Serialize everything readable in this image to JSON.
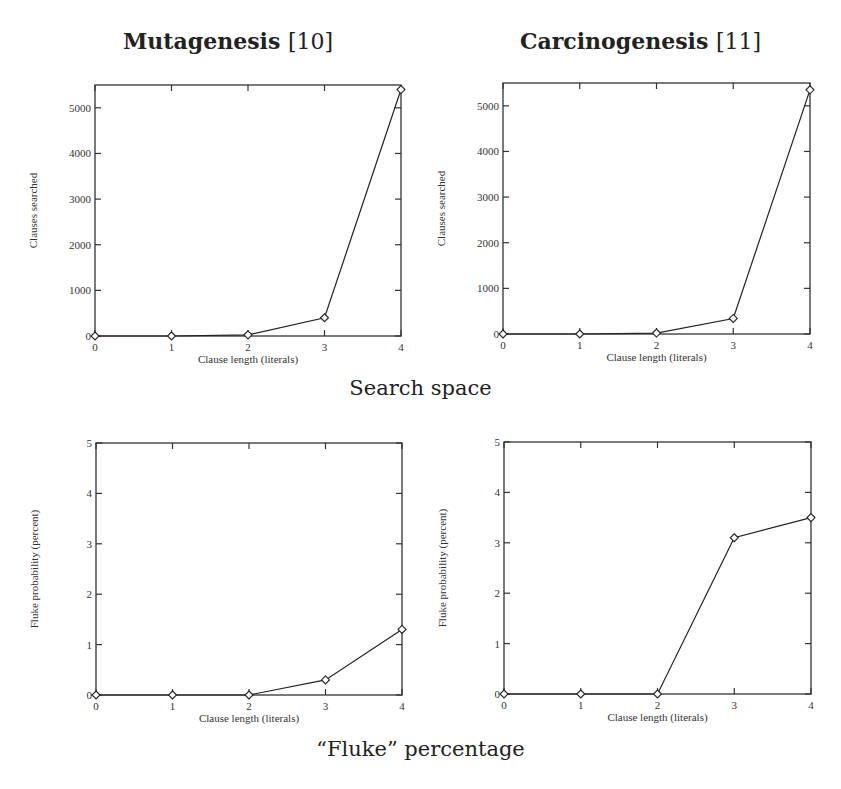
{
  "columns": [
    {
      "title": "Mutagenesis",
      "ref": "[10]"
    },
    {
      "title": "Carcinogenesis",
      "ref": "[11]"
    }
  ],
  "captions": {
    "search_space": "Search space",
    "fluke": "“Fluke”  percentage"
  },
  "chart_data": [
    {
      "type": "line",
      "title": "Mutagenesis [10]",
      "panel": "Search space",
      "xlabel": "Clause length (literals)",
      "ylabel": "Clauses searched",
      "x": [
        0,
        1,
        2,
        3,
        4
      ],
      "series": [
        {
          "name": "Clauses searched",
          "values": [
            0,
            0,
            25,
            400,
            5400
          ],
          "marker": "diamond"
        }
      ],
      "xlim": [
        0,
        4
      ],
      "ylim": [
        0,
        5500
      ],
      "xticks": [
        0,
        1,
        2,
        3,
        4
      ],
      "yticks": [
        0,
        1000,
        2000,
        3000,
        4000,
        5000
      ],
      "grid": false,
      "legend": null
    },
    {
      "type": "line",
      "title": "Carcinogenesis [11]",
      "panel": "Search space",
      "xlabel": "Clause length (literals)",
      "ylabel": "Clauses searched",
      "x": [
        0,
        1,
        2,
        3,
        4
      ],
      "series": [
        {
          "name": "Clauses searched",
          "values": [
            0,
            0,
            20,
            340,
            5350
          ],
          "marker": "diamond"
        }
      ],
      "xlim": [
        0,
        4
      ],
      "ylim": [
        0,
        5500
      ],
      "xticks": [
        0,
        1,
        2,
        3,
        4
      ],
      "yticks": [
        0,
        1000,
        2000,
        3000,
        4000,
        5000
      ],
      "grid": false,
      "legend": null
    },
    {
      "type": "line",
      "title": "Mutagenesis [10]",
      "panel": "“Fluke” percentage",
      "xlabel": "Clause length (literals)",
      "ylabel": "Fluke probability (percent)",
      "x": [
        0,
        1,
        2,
        3,
        4
      ],
      "series": [
        {
          "name": "Fluke probability",
          "values": [
            0,
            0,
            0,
            0.3,
            1.3
          ],
          "marker": "diamond"
        }
      ],
      "xlim": [
        0,
        4
      ],
      "ylim": [
        0,
        5
      ],
      "xticks": [
        0,
        1,
        2,
        3,
        4
      ],
      "yticks": [
        0,
        1,
        2,
        3,
        4,
        5
      ],
      "grid": false,
      "legend": null
    },
    {
      "type": "line",
      "title": "Carcinogenesis [11]",
      "panel": "“Fluke” percentage",
      "xlabel": "Clause length (literals)",
      "ylabel": "Fluke probability (percent)",
      "x": [
        0,
        1,
        2,
        3,
        4
      ],
      "series": [
        {
          "name": "Fluke probability",
          "values": [
            0,
            0,
            0,
            3.1,
            3.5
          ],
          "marker": "diamond"
        }
      ],
      "xlim": [
        0,
        4
      ],
      "ylim": [
        0,
        5
      ],
      "xticks": [
        0,
        1,
        2,
        3,
        4
      ],
      "yticks": [
        0,
        1,
        2,
        3,
        4,
        5
      ],
      "grid": false,
      "legend": null
    }
  ]
}
